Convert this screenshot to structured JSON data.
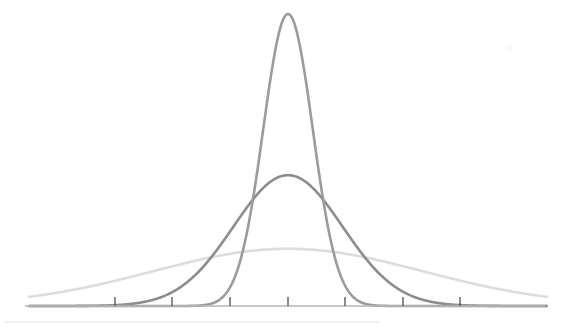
{
  "chart_data": {
    "type": "line",
    "title": "",
    "subtitle": "",
    "xlabel": "",
    "ylabel": "",
    "grid": false,
    "legend": "none",
    "background_color": "#ffffff",
    "axis_color": "#b4b4b4",
    "tick_color": "#4d4d4d",
    "x": [
      -3.5,
      -3.0,
      -2.5,
      -2.0,
      -1.5,
      -1.0,
      -0.5,
      0.0,
      0.5,
      1.0,
      1.5,
      2.0,
      2.5,
      3.0,
      3.5
    ],
    "xlim": [
      -4.5,
      4.5
    ],
    "ylim": [
      0,
      1.0
    ],
    "xticks": [
      -3,
      -2,
      -1,
      0,
      1,
      2,
      3
    ],
    "xticklabels": [
      "",
      "",
      "",
      "",
      "",
      "",
      ""
    ],
    "series": [
      {
        "name": "sigma-small",
        "color": "#9b9b9b",
        "linewidth": 2.6,
        "mean": 0,
        "sigma": 0.43,
        "peak_height": 1.0,
        "values": [
          0.0,
          0.0,
          0.0,
          0.0,
          0.002,
          0.063,
          0.521,
          1.0,
          0.521,
          0.063,
          0.002,
          0.0,
          0.0,
          0.0,
          0.0
        ]
      },
      {
        "name": "sigma-medium",
        "color": "#8c8c8c",
        "linewidth": 2.6,
        "mean": 0,
        "sigma": 0.95,
        "peak_height": 0.448,
        "values": [
          0.001,
          0.005,
          0.022,
          0.075,
          0.128,
          0.255,
          0.392,
          0.448,
          0.392,
          0.255,
          0.128,
          0.075,
          0.022,
          0.005,
          0.001
        ]
      },
      {
        "name": "sigma-large",
        "color": "#dcdcdc",
        "linewidth": 2.6,
        "mean": 0,
        "sigma": 2.35,
        "peak_height": 0.196,
        "values": [
          0.078,
          0.129,
          0.16,
          0.173,
          0.182,
          0.189,
          0.194,
          0.196,
          0.194,
          0.189,
          0.182,
          0.173,
          0.16,
          0.129,
          0.078
        ]
      }
    ]
  },
  "layout": {
    "width": 570,
    "height": 329,
    "baseline_y": 306,
    "center_x": 288,
    "axis_x_start": 25,
    "axis_x_end": 545,
    "tick_positions": [
      115,
      172,
      230,
      288,
      345,
      403,
      460
    ],
    "tick_height": 9,
    "footer_rule": {
      "x_start": 4,
      "x_end": 380,
      "y": 322,
      "color": "#e2e2e2"
    },
    "artifact": {
      "x": 510,
      "y": 48,
      "radius": 3
    }
  }
}
